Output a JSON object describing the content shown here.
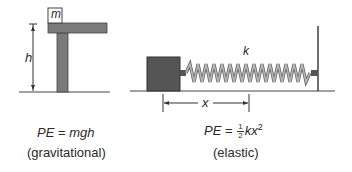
{
  "gravitational": {
    "mass_label": "m",
    "height_label": "h",
    "formula_lhs": "PE",
    "formula_eq": " = ",
    "formula_rhs": "mgh",
    "caption": "(gravitational)"
  },
  "elastic": {
    "spring_constant_label": "k",
    "displacement_label": "x",
    "formula_lhs": "PE",
    "formula_eq": " = ",
    "frac_num": "1",
    "frac_den": "2",
    "formula_rhs": "kx",
    "formula_exp": "2",
    "caption": "(elastic)"
  },
  "colors": {
    "block_fill": "#555555",
    "table_fill": "#7a7a7a",
    "spring_dark": "#666666",
    "spring_light": "#b0b0b0",
    "line": "#333333"
  }
}
